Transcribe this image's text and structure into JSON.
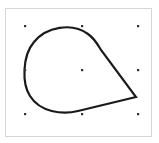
{
  "header": {
    "faint_text": ""
  },
  "canvas": {
    "shape": {
      "type": "teardrop",
      "stroke_color": "#1a1a1a",
      "stroke_width": 2.2,
      "fill": "#ffffff"
    },
    "selection_handles": [
      {
        "name": "top-left",
        "x": 25,
        "y": 26
      },
      {
        "name": "top-center",
        "x": 82,
        "y": 26
      },
      {
        "name": "top-right",
        "x": 138,
        "y": 26
      },
      {
        "name": "middle-left",
        "x": 25,
        "y": 70
      },
      {
        "name": "center",
        "x": 82,
        "y": 70
      },
      {
        "name": "middle-right",
        "x": 138,
        "y": 70
      },
      {
        "name": "bottom-left",
        "x": 25,
        "y": 114
      },
      {
        "name": "bottom-center",
        "x": 82,
        "y": 114
      },
      {
        "name": "bottom-right",
        "x": 138,
        "y": 114
      }
    ],
    "handle_color": "#333333"
  }
}
